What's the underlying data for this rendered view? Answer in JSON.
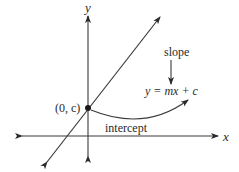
{
  "diagram": {
    "axes": {
      "x_label": "x",
      "y_label": "y"
    },
    "point": {
      "label": "(0, c)"
    },
    "annotations": {
      "slope_label": "slope",
      "equation": "y = mx + c",
      "intercept_label": "intercept"
    },
    "colors": {
      "line": "#3a3a3a",
      "text": "#2a2a2a",
      "background": "#ffffff"
    }
  }
}
